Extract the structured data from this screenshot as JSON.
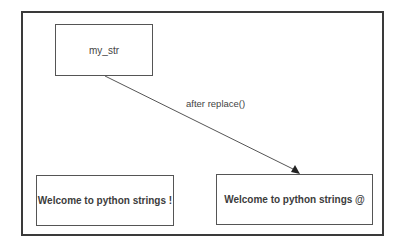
{
  "diagram": {
    "nodes": [
      {
        "id": "source",
        "label": "my_str"
      },
      {
        "id": "original",
        "label": "Welcome to python strings !"
      },
      {
        "id": "replaced",
        "label": "Welcome to python strings @"
      }
    ],
    "edges": [
      {
        "from": "source",
        "to": "replaced",
        "label": "after replace()"
      }
    ]
  },
  "colors": {
    "frame": "#3a3a3a",
    "box_border": "#555555",
    "arrow": "#555555",
    "text": "#3c3c3c"
  }
}
